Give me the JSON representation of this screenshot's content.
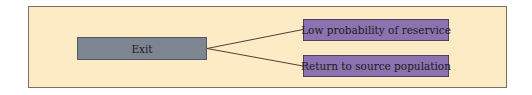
{
  "diagram": {
    "colors": {
      "panel_background": "#fcebc4",
      "panel_border": "#7a6f66",
      "source_node_fill": "#7d8591",
      "outcome_node_fill": "#8c72ae",
      "connector": "#4a4238"
    },
    "source_node": {
      "label": "Exit"
    },
    "outcome_nodes": [
      {
        "label": "Low probability of reservice"
      },
      {
        "label": "Return to source population"
      }
    ],
    "edges": [
      {
        "from": "Exit",
        "to": "Low probability of reservice"
      },
      {
        "from": "Exit",
        "to": "Return to source population"
      }
    ]
  }
}
